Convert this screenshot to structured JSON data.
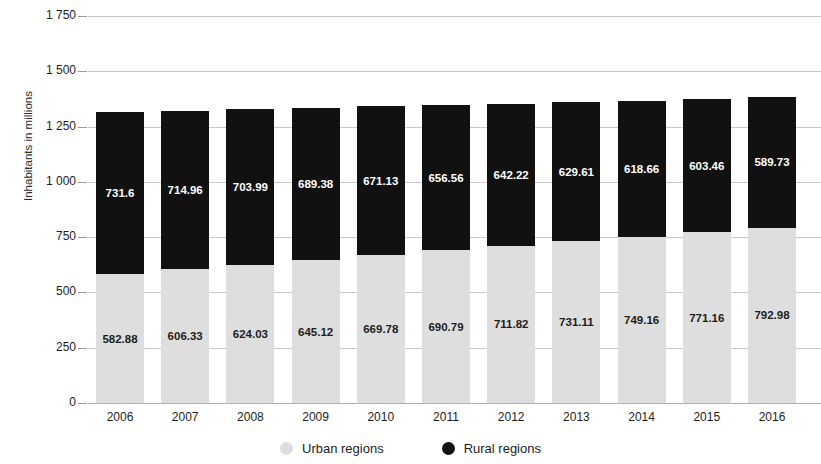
{
  "chart_data": {
    "type": "bar",
    "stacked": true,
    "title": "",
    "subtitle": "",
    "xlabel": "",
    "ylabel": "Inhabitants in millions",
    "categories": [
      "2006",
      "2007",
      "2008",
      "2009",
      "2010",
      "2011",
      "2012",
      "2013",
      "2014",
      "2015",
      "2016"
    ],
    "series": [
      {
        "name": "Urban regions",
        "color": "#dedede",
        "values": [
          582.88,
          606.33,
          624.03,
          645.12,
          669.78,
          690.79,
          711.82,
          731.11,
          749.16,
          771.16,
          792.98
        ],
        "labels": [
          "582.88",
          "606.33",
          "624.03",
          "645.12",
          "669.78",
          "690.79",
          "711.82",
          "731.11",
          "749.16",
          "771.16",
          "792.98"
        ]
      },
      {
        "name": "Rural regions",
        "color": "#111111",
        "values": [
          731.6,
          714.96,
          703.99,
          689.38,
          671.13,
          656.56,
          642.22,
          629.61,
          618.66,
          603.46,
          589.73
        ],
        "labels": [
          "731.6",
          "714.96",
          "703.99",
          "689.38",
          "671.13",
          "656.56",
          "642.22",
          "629.61",
          "618.66",
          "603.46",
          "589.73"
        ]
      }
    ],
    "ylim": [
      0,
      1750
    ],
    "yticks": [
      0,
      250,
      500,
      750,
      1000,
      1250,
      1500,
      1750
    ],
    "ytick_labels": [
      "0",
      "250",
      "500",
      "750",
      "1 000",
      "1 250",
      "1 500",
      "1 750"
    ],
    "grid": true,
    "legend_position": "bottom",
    "legend": [
      {
        "label": "Urban regions",
        "color": "#dedede",
        "marker": "circle"
      },
      {
        "label": "Rural regions",
        "color": "#111111",
        "marker": "circle"
      }
    ]
  }
}
